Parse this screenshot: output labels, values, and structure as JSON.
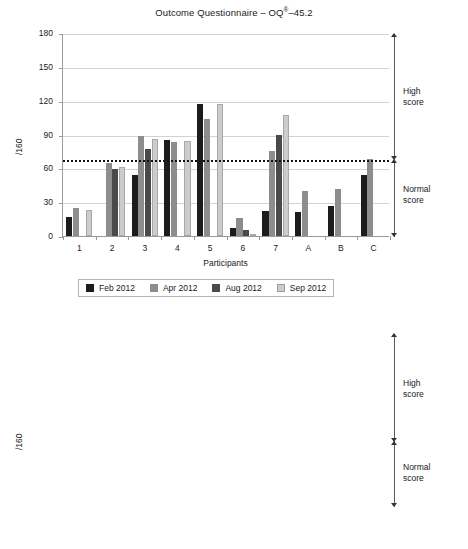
{
  "chart_data": [
    {
      "type": "bar",
      "id": "oq45-participants",
      "title": "Outcome Questionnaire – OQ®–45.2",
      "title_main": "Outcome Questionnaire – OQ",
      "title_reg": "®",
      "title_tail": "–45.2",
      "xlabel": "Participants",
      "ylabel": "/160",
      "ylim": [
        0,
        180
      ],
      "yticks": [
        0,
        30,
        60,
        90,
        120,
        150,
        180
      ],
      "grid": true,
      "legend_position": "bottom",
      "categories": [
        "1",
        "2",
        "3",
        "4",
        "5",
        "6",
        "7",
        "A",
        "B",
        "C"
      ],
      "series": [
        {
          "name": "Feb 2012",
          "color": "#1c1c1c",
          "values": [
            17,
            null,
            54,
            85,
            117,
            7,
            22,
            21,
            27,
            54
          ]
        },
        {
          "name": "Apr 2012",
          "color": "#8d8d8d",
          "values": [
            25,
            65,
            89,
            83,
            104,
            16,
            75,
            40,
            42,
            68
          ]
        },
        {
          "name": "Aug 2012",
          "color": "#4a4a4a",
          "values": [
            null,
            59,
            77,
            null,
            null,
            5,
            90,
            null,
            null,
            null
          ]
        },
        {
          "name": "Sep 2012",
          "color": "#cccccc",
          "values": [
            23,
            61,
            86,
            84,
            117,
            2,
            107,
            null,
            null,
            null
          ]
        }
      ],
      "cutoff": {
        "value": 68,
        "style": "dotted"
      },
      "annotations": [
        {
          "label": "High\nscore",
          "label_line1": "High",
          "label_line2": "score",
          "range": [
            68,
            180
          ]
        },
        {
          "label": "Normal\nscore",
          "label_line1": "Normal",
          "label_line2": "score",
          "range": [
            0,
            68
          ]
        }
      ]
    },
    {
      "type": "line",
      "id": "oq45-average",
      "title": "",
      "xlabel": "",
      "ylabel": "/160",
      "ylim": [
        0,
        180
      ],
      "yticks": [
        0,
        30,
        60,
        90,
        120,
        150,
        180
      ],
      "grid": true,
      "legend_position": "top-left",
      "x": [
        "Feb 2012",
        "Apr 2012",
        "Aug 2012",
        "Sep 2012"
      ],
      "series": [
        {
          "name": "Average",
          "color": "#111111",
          "marker": "diamond",
          "values": [
            45,
            60.5,
            57,
            67
          ]
        }
      ],
      "cutoff": {
        "value": 68,
        "style": "dotted"
      },
      "annotations": [
        {
          "label_line1": "High",
          "label_line2": "score",
          "range": [
            68,
            180
          ]
        },
        {
          "label_line1": "Normal",
          "label_line2": "score",
          "range": [
            0,
            68
          ]
        }
      ]
    }
  ],
  "bar_chart": {
    "title_main": "Outcome Questionnaire – OQ",
    "title_reg": "®",
    "title_tail": "–45.2",
    "ylabel": "/160",
    "xlabel": "Participants",
    "yticks": [
      "180",
      "150",
      "120",
      "90",
      "60",
      "30",
      "0"
    ],
    "xticks": [
      "1",
      "2",
      "3",
      "4",
      "5",
      "6",
      "7",
      "A",
      "B",
      "C"
    ],
    "high_score_line1": "High",
    "high_score_line2": "score",
    "normal_score_line1": "Normal",
    "normal_score_line2": "score",
    "legend": [
      {
        "label": "Feb 2012",
        "color": "#1c1c1c"
      },
      {
        "label": "Apr 2012",
        "color": "#8d8d8d"
      },
      {
        "label": "Aug 2012",
        "color": "#4a4a4a"
      },
      {
        "label": "Sep 2012",
        "color": "#cccccc"
      }
    ]
  },
  "line_chart": {
    "ylabel": "/160",
    "yticks": [
      "180",
      "150",
      "120",
      "90",
      "60",
      "30",
      "0"
    ],
    "xticks": [
      "Feb 2012",
      "Apr 2012",
      "Aug 2012",
      "Sep 2012"
    ],
    "legend_label": "Average",
    "high_score_line1": "High",
    "high_score_line2": "score",
    "normal_score_line1": "Normal",
    "normal_score_line2": "score"
  }
}
